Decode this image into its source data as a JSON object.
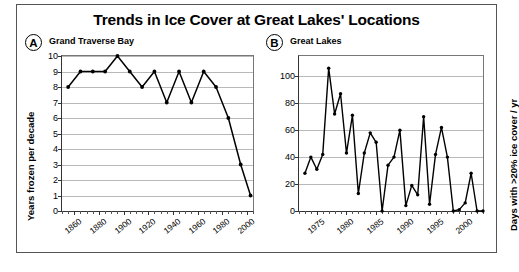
{
  "figure": {
    "title": "Trends in Ice Cover at Great Lakes' Locations"
  },
  "panel_a": {
    "tag": "A",
    "name": "Grand Traverse Bay"
  },
  "panel_b": {
    "tag": "B",
    "name": "Great Lakes"
  },
  "chart_data": [
    {
      "id": "panel-a",
      "type": "line",
      "panel_label": "A",
      "title": "Grand Traverse Bay",
      "xlabel": "",
      "ylabel": "Years frozen per decade",
      "xlim": [
        1850,
        2005
      ],
      "ylim": [
        0,
        10
      ],
      "yticks": [
        0,
        1,
        2,
        3,
        4,
        5,
        6,
        7,
        8,
        9,
        10
      ],
      "xticks": [
        1860,
        1880,
        1900,
        1920,
        1940,
        1960,
        1980,
        2000
      ],
      "xtick_labels": [
        "1860",
        "1880",
        "1900",
        "1920",
        "1940",
        "1960",
        "1980",
        "2000"
      ],
      "grid": true,
      "legend": "none",
      "markers": true,
      "x": [
        1855,
        1865,
        1875,
        1885,
        1895,
        1905,
        1915,
        1925,
        1935,
        1945,
        1955,
        1965,
        1975,
        1985,
        1995,
        2003
      ],
      "values": [
        8,
        9,
        9,
        9,
        10,
        9,
        8,
        9,
        7,
        9,
        7,
        9,
        8,
        6,
        3,
        1
      ]
    },
    {
      "id": "panel-b",
      "type": "line",
      "panel_label": "B",
      "title": "Great Lakes",
      "xlabel": "",
      "ylabel": "Days with >20% ice cover / yr",
      "xlim": [
        1972,
        2003
      ],
      "ylim": [
        0,
        115
      ],
      "yticks": [
        0,
        20,
        40,
        60,
        80,
        100
      ],
      "xticks": [
        1975,
        1980,
        1985,
        1990,
        1995,
        2000
      ],
      "xtick_labels": [
        "1975",
        "1980",
        "1985",
        "1990",
        "1995",
        "2000"
      ],
      "grid": true,
      "legend": "none",
      "markers": true,
      "x": [
        1973,
        1974,
        1975,
        1976,
        1977,
        1978,
        1979,
        1980,
        1981,
        1982,
        1983,
        1984,
        1985,
        1986,
        1987,
        1988,
        1989,
        1990,
        1991,
        1992,
        1993,
        1994,
        1995,
        1996,
        1997,
        1998,
        1999,
        2000,
        2001,
        2002,
        2003
      ],
      "values": [
        28,
        40,
        31,
        42,
        106,
        72,
        87,
        43,
        71,
        13,
        43,
        58,
        51,
        0,
        34,
        40,
        60,
        4,
        19,
        12,
        70,
        5,
        42,
        62,
        40,
        0,
        1,
        6,
        28,
        0,
        0
      ]
    }
  ]
}
